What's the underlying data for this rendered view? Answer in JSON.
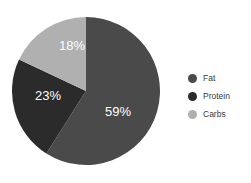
{
  "chart_data": {
    "type": "pie",
    "title": "",
    "categories": [
      "Fat",
      "Protein",
      "Carbs"
    ],
    "values": [
      59,
      23,
      18
    ],
    "value_labels": [
      "59%",
      "23%",
      "18%"
    ],
    "colors": [
      "#4a4a4a",
      "#2b2b2b",
      "#b0b0b0"
    ],
    "units": "percent",
    "total": 100,
    "start_angle_deg": 0,
    "direction": "clockwise",
    "legend_position": "right",
    "label_position": "inside",
    "label_color": "#ffffff",
    "background": "#ffffff",
    "slices": [
      {
        "name": "Fat",
        "value": 59,
        "label": "59%",
        "color": "#4a4a4a",
        "label_x": 118,
        "label_y": 113
      },
      {
        "name": "Protein",
        "value": 23,
        "label": "23%",
        "color": "#2b2b2b",
        "label_x": 48,
        "label_y": 97
      },
      {
        "name": "Carbs",
        "value": 18,
        "label": "18%",
        "color": "#b0b0b0",
        "label_x": 72,
        "label_y": 47
      }
    ],
    "geometry": {
      "cx": 86,
      "cy": 91,
      "r": 74
    }
  },
  "legend": {
    "items": [
      {
        "label": "Fat",
        "color": "#4a4a4a"
      },
      {
        "label": "Protein",
        "color": "#2b2b2b"
      },
      {
        "label": "Carbs",
        "color": "#b0b0b0"
      }
    ]
  }
}
